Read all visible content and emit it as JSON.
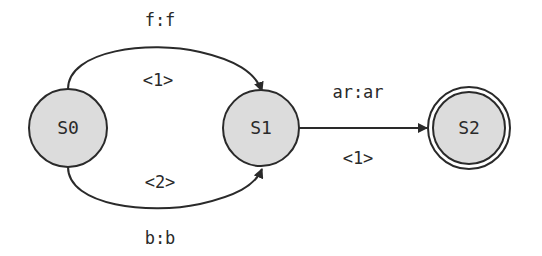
{
  "diagram": {
    "type": "finite-state-transducer",
    "colors": {
      "node_fill": "#dcdcdc",
      "stroke": "#2a2a2a",
      "background": "#ffffff"
    },
    "nodes": [
      {
        "id": "S0",
        "label": "S0",
        "final": false
      },
      {
        "id": "S1",
        "label": "S1",
        "final": false
      },
      {
        "id": "S2",
        "label": "S2",
        "final": true
      }
    ],
    "edges": [
      {
        "from": "S0",
        "to": "S1",
        "io": "f:f",
        "weight": "<1>"
      },
      {
        "from": "S0",
        "to": "S1",
        "io": "b:b",
        "weight": "<2>"
      },
      {
        "from": "S1",
        "to": "S2",
        "io": "ar:ar",
        "weight": "<1>"
      }
    ]
  }
}
